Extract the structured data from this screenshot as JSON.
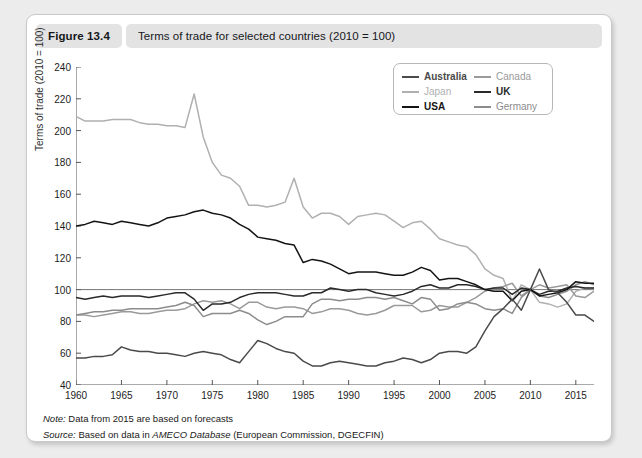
{
  "header": {
    "figure_number": "Figure 13.4",
    "title": "Terms of trade for selected countries (2010 = 100)"
  },
  "notes": {
    "note_label": "Note:",
    "note_text": "Data from 2015 are based on forecasts",
    "source_label": "Source:",
    "source_text_pre": "Based on data in ",
    "source_italic": "AMECO Database",
    "source_text_post": " (European Commission, DGECFIN)"
  },
  "chart_data": {
    "type": "line",
    "title": "Terms of trade for selected countries (2010 = 100)",
    "xlabel": "",
    "ylabel": "Terms of trade (2010 = 100)",
    "xlim": [
      1960,
      2017
    ],
    "ylim": [
      40,
      240
    ],
    "yticks": [
      40,
      60,
      80,
      100,
      120,
      140,
      160,
      180,
      200,
      220,
      240
    ],
    "xticks": [
      1960,
      1965,
      1970,
      1975,
      1980,
      1985,
      1990,
      1995,
      2000,
      2005,
      2010,
      2015
    ],
    "grid": false,
    "reference_line": 100,
    "legend_position": "top-right",
    "legend_columns": 2,
    "x": [
      1960,
      1961,
      1962,
      1963,
      1964,
      1965,
      1966,
      1967,
      1968,
      1969,
      1970,
      1971,
      1972,
      1973,
      1974,
      1975,
      1976,
      1977,
      1978,
      1979,
      1980,
      1981,
      1982,
      1983,
      1984,
      1985,
      1986,
      1987,
      1988,
      1989,
      1990,
      1991,
      1992,
      1993,
      1994,
      1995,
      1996,
      1997,
      1998,
      1999,
      2000,
      2001,
      2002,
      2003,
      2004,
      2005,
      2006,
      2007,
      2008,
      2009,
      2010,
      2011,
      2012,
      2013,
      2014,
      2015,
      2016,
      2017
    ],
    "series": [
      {
        "name": "Japan",
        "color": "#b0b0b0",
        "values": [
          209,
          206,
          206,
          206,
          207,
          207,
          207,
          205,
          204,
          204,
          203,
          203,
          202,
          223,
          196,
          180,
          172,
          170,
          165,
          153,
          153,
          152,
          153,
          155,
          170,
          152,
          145,
          148,
          148,
          146,
          141,
          146,
          147,
          148,
          147,
          143,
          139,
          142,
          143,
          138,
          132,
          130,
          128,
          127,
          122,
          113,
          109,
          107,
          93,
          103,
          100,
          92,
          91,
          89,
          91,
          99,
          101,
          101
        ]
      },
      {
        "name": "Canada",
        "color": "#9a9a9a",
        "values": [
          84,
          84,
          83,
          84,
          85,
          86,
          86,
          85,
          85,
          86,
          87,
          87,
          88,
          91,
          93,
          92,
          93,
          91,
          88,
          92,
          92,
          89,
          88,
          89,
          89,
          88,
          85,
          86,
          88,
          88,
          87,
          85,
          84,
          85,
          87,
          90,
          90,
          90,
          86,
          87,
          90,
          89,
          89,
          92,
          95,
          99,
          101,
          102,
          104,
          96,
          100,
          103,
          101,
          102,
          103,
          96,
          95,
          99
        ]
      },
      {
        "name": "Germany",
        "color": "#8c8c8c",
        "values": [
          84,
          85,
          86,
          86,
          87,
          87,
          88,
          88,
          88,
          88,
          89,
          90,
          92,
          90,
          83,
          85,
          85,
          85,
          87,
          85,
          81,
          78,
          80,
          83,
          83,
          83,
          91,
          94,
          94,
          93,
          94,
          94,
          95,
          95,
          94,
          95,
          93,
          91,
          95,
          94,
          87,
          88,
          91,
          92,
          91,
          88,
          87,
          88,
          85,
          95,
          100,
          96,
          95,
          97,
          99,
          103,
          105,
          103
        ]
      },
      {
        "name": "UK",
        "color": "#2a2a2a",
        "values": [
          95,
          94,
          95,
          96,
          95,
          96,
          96,
          96,
          95,
          96,
          97,
          98,
          98,
          94,
          87,
          91,
          91,
          92,
          95,
          97,
          98,
          98,
          98,
          97,
          96,
          96,
          98,
          98,
          101,
          100,
          99,
          100,
          100,
          98,
          97,
          96,
          97,
          99,
          102,
          103,
          101,
          101,
          103,
          103,
          102,
          100,
          101,
          101,
          97,
          101,
          100,
          97,
          99,
          99,
          101,
          102,
          101,
          101
        ]
      },
      {
        "name": "USA",
        "color": "#141414",
        "values": [
          140,
          141,
          143,
          142,
          141,
          143,
          142,
          141,
          140,
          142,
          145,
          146,
          147,
          149,
          150,
          148,
          147,
          145,
          141,
          138,
          133,
          132,
          131,
          129,
          128,
          117,
          119,
          118,
          116,
          113,
          110,
          111,
          111,
          111,
          110,
          109,
          109,
          111,
          114,
          112,
          106,
          107,
          107,
          105,
          103,
          100,
          99,
          99,
          93,
          99,
          100,
          96,
          97,
          98,
          100,
          105,
          104,
          104
        ]
      },
      {
        "name": "Australia",
        "color": "#4a4a4a",
        "values": [
          57,
          57,
          58,
          58,
          59,
          64,
          62,
          61,
          61,
          60,
          60,
          59,
          58,
          60,
          61,
          60,
          59,
          56,
          54,
          61,
          68,
          66,
          63,
          61,
          60,
          55,
          52,
          52,
          54,
          55,
          54,
          53,
          52,
          52,
          54,
          55,
          57,
          56,
          54,
          56,
          60,
          61,
          61,
          60,
          64,
          74,
          83,
          88,
          94,
          87,
          100,
          113,
          100,
          98,
          92,
          84,
          84,
          80
        ]
      }
    ]
  }
}
